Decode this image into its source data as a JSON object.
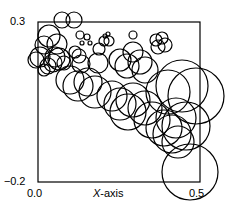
{
  "figure": {
    "background_color": "#ffffff",
    "ink_color": "#000000",
    "width": 237,
    "height": 209
  },
  "axes": {
    "frame": {
      "left": 38,
      "top": 22,
      "right": 200,
      "bottom": 182,
      "line_width": 1.2
    },
    "x_title": {
      "italic_part": "X",
      "rest": "-axis"
    },
    "x_ticks": [
      {
        "label": "0.0",
        "value": 0.0
      },
      {
        "label": "0.5",
        "value": 0.5
      }
    ],
    "y_ticks": [
      {
        "label": "0.3",
        "value": 0.3
      },
      {
        "label": "−0.2",
        "value": -0.2
      }
    ]
  },
  "chart_data": {
    "type": "scatter",
    "variant": "bubble",
    "title": "",
    "xlabel": "X-axis",
    "ylabel": "",
    "xlim": [
      0.0,
      0.5
    ],
    "ylim": [
      -0.2,
      0.3
    ],
    "grid": false,
    "legend": null,
    "marker": {
      "shape": "circle",
      "filled": false,
      "edge_color": "#000000",
      "face_color": "none",
      "line_width": 1.2
    },
    "note": "Bubble radius encodes a third variable that increases with x; points form a descending band from upper-left to lower-right. Radii below are in pixels of the rendered figure.",
    "points_px": [
      {
        "cx": 62,
        "cy": 20,
        "r": 8
      },
      {
        "cx": 74,
        "cy": 20,
        "r": 8
      },
      {
        "cx": 49,
        "cy": 36,
        "r": 11
      },
      {
        "cx": 44,
        "cy": 45,
        "r": 9
      },
      {
        "cx": 57,
        "cy": 44,
        "r": 10
      },
      {
        "cx": 40,
        "cy": 57,
        "r": 10
      },
      {
        "cx": 36,
        "cy": 60,
        "r": 8
      },
      {
        "cx": 55,
        "cy": 57,
        "r": 10
      },
      {
        "cx": 59,
        "cy": 59,
        "r": 11
      },
      {
        "cx": 53,
        "cy": 63,
        "r": 9
      },
      {
        "cx": 48,
        "cy": 66,
        "r": 8
      },
      {
        "cx": 64,
        "cy": 63,
        "r": 7
      },
      {
        "cx": 44,
        "cy": 70,
        "r": 6
      },
      {
        "cx": 80,
        "cy": 35,
        "r": 4
      },
      {
        "cx": 87,
        "cy": 37,
        "r": 3
      },
      {
        "cx": 82,
        "cy": 43,
        "r": 2
      },
      {
        "cx": 90,
        "cy": 43,
        "r": 2
      },
      {
        "cx": 105,
        "cy": 36,
        "r": 2
      },
      {
        "cx": 108,
        "cy": 34,
        "r": 2
      },
      {
        "cx": 104,
        "cy": 41,
        "r": 5
      },
      {
        "cx": 109,
        "cy": 41,
        "r": 5
      },
      {
        "cx": 133,
        "cy": 35,
        "r": 4
      },
      {
        "cx": 99,
        "cy": 49,
        "r": 6
      },
      {
        "cx": 75,
        "cy": 52,
        "r": 6
      },
      {
        "cx": 79,
        "cy": 56,
        "r": 7
      },
      {
        "cx": 81,
        "cy": 64,
        "r": 9
      },
      {
        "cx": 98,
        "cy": 63,
        "r": 10
      },
      {
        "cx": 156,
        "cy": 40,
        "r": 6
      },
      {
        "cx": 162,
        "cy": 38,
        "r": 6
      },
      {
        "cx": 158,
        "cy": 47,
        "r": 7
      },
      {
        "cx": 165,
        "cy": 45,
        "r": 7
      },
      {
        "cx": 133,
        "cy": 52,
        "r": 10
      },
      {
        "cx": 120,
        "cy": 60,
        "r": 11
      },
      {
        "cx": 127,
        "cy": 66,
        "r": 12
      },
      {
        "cx": 140,
        "cy": 62,
        "r": 12
      },
      {
        "cx": 145,
        "cy": 70,
        "r": 13
      },
      {
        "cx": 70,
        "cy": 80,
        "r": 14
      },
      {
        "cx": 78,
        "cy": 86,
        "r": 15
      },
      {
        "cx": 88,
        "cy": 82,
        "r": 14
      },
      {
        "cx": 95,
        "cy": 92,
        "r": 16
      },
      {
        "cx": 112,
        "cy": 96,
        "r": 15
      },
      {
        "cx": 120,
        "cy": 104,
        "r": 16
      },
      {
        "cx": 133,
        "cy": 100,
        "r": 17
      },
      {
        "cx": 128,
        "cy": 112,
        "r": 18
      },
      {
        "cx": 145,
        "cy": 108,
        "r": 17
      },
      {
        "cx": 152,
        "cy": 120,
        "r": 18
      },
      {
        "cx": 168,
        "cy": 92,
        "r": 22
      },
      {
        "cx": 182,
        "cy": 86,
        "r": 26
      },
      {
        "cx": 196,
        "cy": 96,
        "r": 28
      },
      {
        "cx": 176,
        "cy": 118,
        "r": 20
      },
      {
        "cx": 164,
        "cy": 128,
        "r": 18
      },
      {
        "cx": 172,
        "cy": 134,
        "r": 19
      },
      {
        "cx": 186,
        "cy": 126,
        "r": 24
      },
      {
        "cx": 178,
        "cy": 142,
        "r": 16
      },
      {
        "cx": 190,
        "cy": 172,
        "r": 28
      }
    ]
  }
}
